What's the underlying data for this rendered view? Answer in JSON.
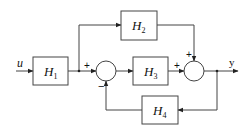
{
  "diagram": {
    "type": "block-diagram",
    "input": {
      "label": "u"
    },
    "output": {
      "label": "y"
    },
    "blocks": [
      {
        "id": "H1",
        "base": "H",
        "sub": "1"
      },
      {
        "id": "H2",
        "base": "H",
        "sub": "2"
      },
      {
        "id": "H3",
        "base": "H",
        "sub": "3"
      },
      {
        "id": "H4",
        "base": "H",
        "sub": "4"
      }
    ],
    "summing_junctions": [
      {
        "id": "S1",
        "inputs": [
          {
            "from": "H1",
            "sign": "+"
          },
          {
            "from": "H4",
            "sign": "-"
          }
        ]
      },
      {
        "id": "S2",
        "inputs": [
          {
            "from": "H3",
            "sign": "+"
          },
          {
            "from": "H2",
            "sign": "+"
          }
        ]
      }
    ],
    "signs": {
      "s1_left": "+",
      "s1_bottom": "−",
      "s2_left": "+",
      "s2_top": "+"
    },
    "connections": [
      "u -> H1",
      "H1 -> S1 (+)",
      "H1 -> H2",
      "S1 -> H3",
      "H3 -> S2 (+)",
      "H2 -> S2 (+)",
      "S2 -> y",
      "y -> H4",
      "H4 -> S1 (-)"
    ]
  }
}
